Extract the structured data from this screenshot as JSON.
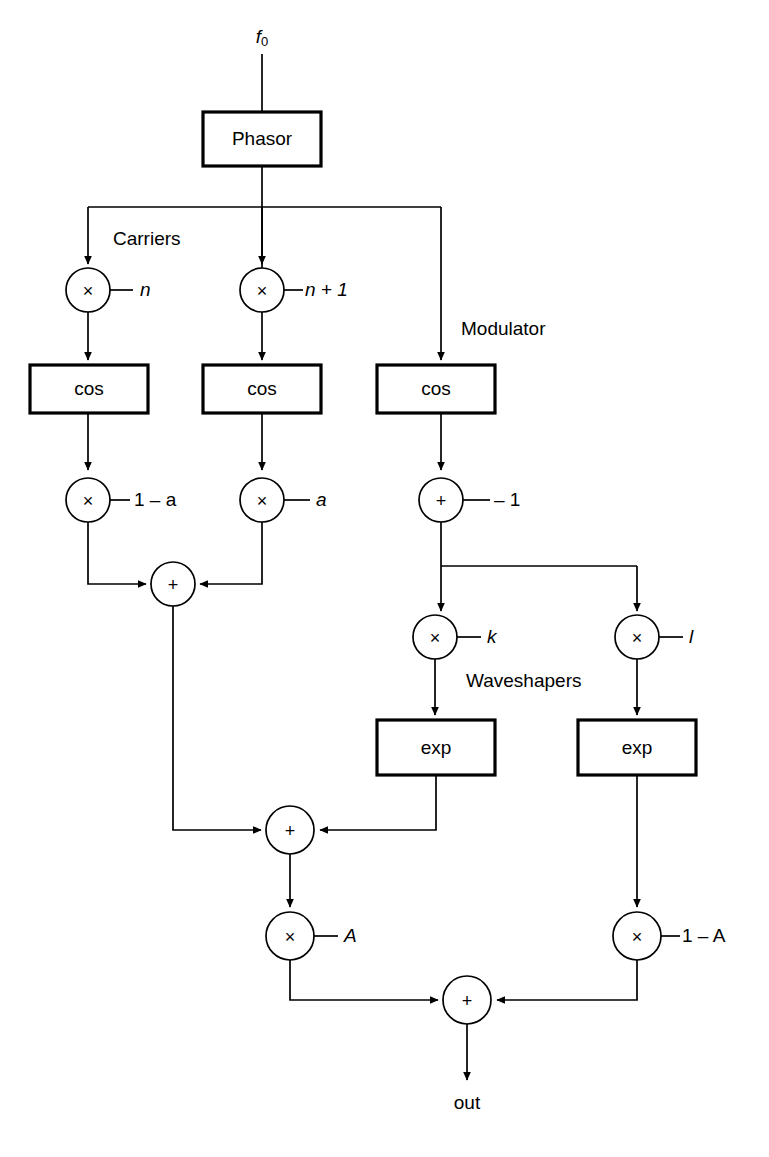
{
  "diagram": {
    "type": "signal-flow-block-diagram",
    "title_visible": false,
    "background_color": "#ffffff",
    "line_color": "#000000",
    "inputs": [
      {
        "id": "f0",
        "label": "f",
        "subscript": "0",
        "x": 262,
        "y": 38
      }
    ],
    "outputs": [
      {
        "id": "out",
        "label": "out",
        "x": 467,
        "y": 1104
      }
    ],
    "section_labels": [
      {
        "id": "carriers",
        "label": "Carriers",
        "x": 113,
        "y": 240
      },
      {
        "id": "modulator",
        "label": "Modulator",
        "x": 461,
        "y": 330
      },
      {
        "id": "waveshapers",
        "label": "Waveshapers",
        "x": 466,
        "y": 682
      }
    ],
    "blocks": [
      {
        "id": "phasor",
        "label": "Phasor",
        "x": 203,
        "y": 112,
        "w": 118,
        "h": 54
      },
      {
        "id": "cos1",
        "label": "cos",
        "x": 30,
        "y": 365,
        "w": 118,
        "h": 48
      },
      {
        "id": "cos2",
        "label": "cos",
        "x": 203,
        "y": 365,
        "w": 118,
        "h": 48
      },
      {
        "id": "cos3",
        "label": "cos",
        "x": 377,
        "y": 365,
        "w": 118,
        "h": 48
      },
      {
        "id": "exp1",
        "label": "exp",
        "x": 377,
        "y": 720,
        "w": 118,
        "h": 55
      },
      {
        "id": "exp2",
        "label": "exp",
        "x": 578,
        "y": 720,
        "w": 118,
        "h": 55
      }
    ],
    "operators": [
      {
        "id": "mul_n",
        "op": "×",
        "cx": 88,
        "cy": 290,
        "r": 22,
        "param": "n",
        "param_style": "italic"
      },
      {
        "id": "mul_n1",
        "op": "×",
        "cx": 262,
        "cy": 290,
        "r": 22,
        "param": "n + 1",
        "param_style": "mixed-italic-first"
      },
      {
        "id": "mul_1ma",
        "op": "×",
        "cx": 88,
        "cy": 500,
        "r": 22,
        "param": "1 – a",
        "param_style": "mixed-italic-last"
      },
      {
        "id": "mul_a",
        "op": "×",
        "cx": 262,
        "cy": 500,
        "r": 22,
        "param": "a",
        "param_style": "italic"
      },
      {
        "id": "add_m1",
        "op": "+",
        "cx": 441,
        "cy": 500,
        "r": 22,
        "param": "– 1",
        "param_style": "roman"
      },
      {
        "id": "sum_carr",
        "op": "+",
        "cx": 173,
        "cy": 584,
        "r": 22,
        "param": "",
        "param_style": "none"
      },
      {
        "id": "mul_k",
        "op": "×",
        "cx": 435,
        "cy": 637,
        "r": 22,
        "param": "k",
        "param_style": "italic"
      },
      {
        "id": "mul_l",
        "op": "×",
        "cx": 637,
        "cy": 637,
        "r": 22,
        "param": "l",
        "param_style": "italic"
      },
      {
        "id": "sum_mid",
        "op": "+",
        "cx": 290,
        "cy": 830,
        "r": 24,
        "param": "",
        "param_style": "none"
      },
      {
        "id": "mul_A",
        "op": "×",
        "cx": 290,
        "cy": 936,
        "r": 24,
        "param": "A",
        "param_style": "italic"
      },
      {
        "id": "mul_1mA",
        "op": "×",
        "cx": 637,
        "cy": 936,
        "r": 24,
        "param": "1 – A",
        "param_style": "mixed-italic-last"
      },
      {
        "id": "sum_out",
        "op": "+",
        "cx": 467,
        "cy": 1000,
        "r": 24,
        "param": "",
        "param_style": "none"
      }
    ],
    "connections": [
      {
        "from": "f0",
        "to": "phasor",
        "kind": "arrow-down"
      },
      {
        "from": "phasor",
        "to": "branch-bus",
        "kind": "line-down"
      },
      {
        "from": "branch-bus",
        "to": "mul_n",
        "kind": "arrow-down"
      },
      {
        "from": "branch-bus",
        "to": "mul_n1",
        "kind": "arrow-down"
      },
      {
        "from": "branch-bus",
        "to": "cos3",
        "kind": "arrow-down"
      },
      {
        "from": "mul_n",
        "to": "cos1",
        "kind": "arrow-down"
      },
      {
        "from": "mul_n1",
        "to": "cos2",
        "kind": "arrow-down"
      },
      {
        "from": "cos1",
        "to": "mul_1ma",
        "kind": "arrow-down"
      },
      {
        "from": "cos2",
        "to": "mul_a",
        "kind": "arrow-down"
      },
      {
        "from": "cos3",
        "to": "add_m1",
        "kind": "arrow-down"
      },
      {
        "from": "mul_1ma",
        "to": "sum_carr",
        "kind": "elbow-right-arrow"
      },
      {
        "from": "mul_a",
        "to": "sum_carr",
        "kind": "elbow-left-arrow"
      },
      {
        "from": "add_m1",
        "to": "mul_k",
        "kind": "arrow-down"
      },
      {
        "from": "add_m1",
        "to": "mul_l",
        "kind": "elbow-down-arrow"
      },
      {
        "from": "mul_k",
        "to": "exp1",
        "kind": "arrow-down"
      },
      {
        "from": "mul_l",
        "to": "exp2",
        "kind": "arrow-down"
      },
      {
        "from": "sum_carr",
        "to": "sum_mid",
        "kind": "elbow-right-arrow"
      },
      {
        "from": "exp1",
        "to": "sum_mid",
        "kind": "elbow-left-arrow"
      },
      {
        "from": "sum_mid",
        "to": "mul_A",
        "kind": "arrow-down"
      },
      {
        "from": "exp2",
        "to": "mul_1mA",
        "kind": "arrow-down"
      },
      {
        "from": "mul_A",
        "to": "sum_out",
        "kind": "elbow-right-arrow"
      },
      {
        "from": "mul_1mA",
        "to": "sum_out",
        "kind": "elbow-left-arrow"
      },
      {
        "from": "sum_out",
        "to": "out",
        "kind": "arrow-down"
      }
    ]
  }
}
